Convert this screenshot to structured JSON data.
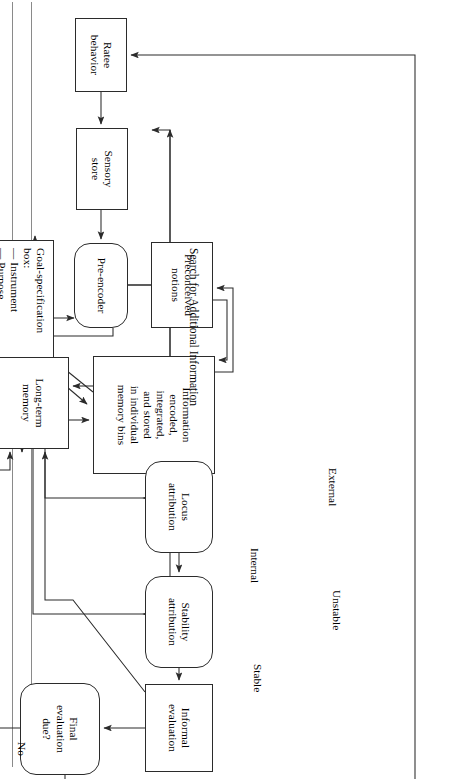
{
  "page": {
    "title": "Search for Additional Information",
    "side_label": "Search for Additional Information"
  },
  "diagram": {
    "type": "flowchart",
    "orientation": "rotated-90-landscape",
    "nodes": [
      {
        "id": "ratee_behavior",
        "label": "Ratee\nbehavior",
        "shape": "rect",
        "x": 18,
        "y": 338,
        "w": 74,
        "h": 52
      },
      {
        "id": "sensory_store",
        "label": "Sensory\nstore",
        "shape": "rect",
        "x": 128,
        "y": 337,
        "w": 82,
        "h": 52
      },
      {
        "id": "preencoder",
        "label": "Pre-encoder",
        "shape": "round",
        "x": 243,
        "y": 337,
        "w": 85,
        "h": 54
      },
      {
        "id": "preconceived",
        "label": "Preconceived\nnotions",
        "shape": "rect",
        "x": 242,
        "y": 252,
        "w": 86,
        "h": 62
      },
      {
        "id": "goal_box",
        "label": "Goal-specification\nbox:\n—  Instrument\n—  Purpose",
        "shape": "rect",
        "x": 240,
        "y": 411,
        "w": 130,
        "h": 84
      },
      {
        "id": "info_encoded",
        "label": "Information\nencoded,\nintegrated,\nand stored\nin individual\nmemory bins",
        "shape": "rect",
        "x": 356,
        "y": 250,
        "w": 118,
        "h": 122
      },
      {
        "id": "ltm",
        "label": "Long-term\nmemory",
        "shape": "rect",
        "x": 357,
        "y": 396,
        "w": 92,
        "h": 72
      },
      {
        "id": "locus",
        "label": "Locus\nattribution",
        "shape": "round",
        "x": 461,
        "y": 252,
        "w": 92,
        "h": 68
      },
      {
        "id": "stability",
        "label": "Stability\nattribution",
        "shape": "round",
        "x": 576,
        "y": 252,
        "w": 92,
        "h": 68
      },
      {
        "id": "informal_eval",
        "label": "Informal\nevaluation",
        "shape": "rect",
        "x": 684,
        "y": 252,
        "w": 88,
        "h": 68
      },
      {
        "id": "final_eval_due",
        "label": "Final\nevaluation\ndue?",
        "shape": "round",
        "x": 683,
        "y": 365,
        "w": 92,
        "h": 80
      },
      {
        "id": "data_integrated",
        "label": "Data integrated\nand translated\ninto rating",
        "shape": "rect",
        "x": 667,
        "y": 489,
        "w": 112,
        "h": 86
      },
      {
        "id": "final_rating",
        "label": "Final rating",
        "shape": "rect",
        "x": 682,
        "y": 605,
        "w": 88,
        "h": 50
      },
      {
        "id": "consequences",
        "label": "Consequences",
        "shape": "rect",
        "x": 679,
        "y": 682,
        "w": 92,
        "h": 54
      }
    ],
    "edge_labels": [
      {
        "id": "no_label",
        "text": "No",
        "x": 742,
        "y": 437
      },
      {
        "id": "yes_label",
        "text": "Yes",
        "x": 723,
        "y": 463
      },
      {
        "id": "stable_label",
        "text": "Stable",
        "x": 664,
        "y": 201
      },
      {
        "id": "unstable_label",
        "text": "Unstable",
        "x": 590,
        "y": 122
      },
      {
        "id": "internal_label",
        "text": "Internal",
        "x": 548,
        "y": 204
      },
      {
        "id": "external_label",
        "text": "External",
        "x": 468,
        "y": 126
      }
    ]
  },
  "colors": {
    "ink": "#2b2b2b",
    "background": "#ffffff",
    "sheet_rule": "#8a8a8a"
  }
}
